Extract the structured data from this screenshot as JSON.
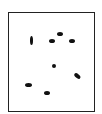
{
  "diagram": {
    "frame": {
      "stroke": "#222222",
      "fill": "#ffffff"
    },
    "ellipses": [
      {
        "cx": 31,
        "cy": 40,
        "w": 3,
        "h": 9,
        "rot": 0
      },
      {
        "cx": 52,
        "cy": 41,
        "w": 6,
        "h": 4,
        "rot": 0
      },
      {
        "cx": 60,
        "cy": 34,
        "w": 6,
        "h": 4,
        "rot": 0
      },
      {
        "cx": 72,
        "cy": 41,
        "w": 6,
        "h": 4,
        "rot": 0
      },
      {
        "cx": 54,
        "cy": 66,
        "w": 4,
        "h": 4,
        "rot": 0
      },
      {
        "cx": 77,
        "cy": 76,
        "w": 7,
        "h": 3.5,
        "rot": 40
      },
      {
        "cx": 28,
        "cy": 85,
        "w": 7,
        "h": 4,
        "rot": 0
      },
      {
        "cx": 47,
        "cy": 93,
        "w": 6,
        "h": 4,
        "rot": 0
      }
    ]
  }
}
